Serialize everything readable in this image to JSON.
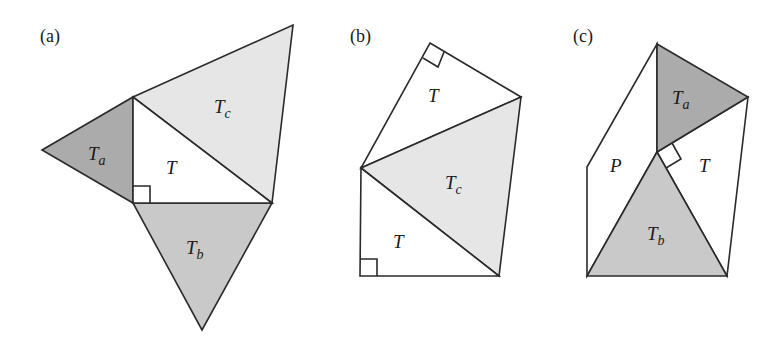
{
  "colors": {
    "stroke": "#2a2a2a",
    "Ta": "#ababab",
    "Tb": "#c9c9c9",
    "Tc": "#e6e6e6",
    "T": "#ffffff",
    "background": "#ffffff"
  },
  "panels": [
    {
      "id": "a",
      "label": "(a)",
      "regions": [
        {
          "name": "T",
          "main": "T",
          "sub": ""
        },
        {
          "name": "Ta",
          "main": "T",
          "sub": "a"
        },
        {
          "name": "Tb",
          "main": "T",
          "sub": "b"
        },
        {
          "name": "Tc",
          "main": "T",
          "sub": "c"
        }
      ]
    },
    {
      "id": "b",
      "label": "(b)",
      "regions": [
        {
          "name": "T-top",
          "main": "T",
          "sub": ""
        },
        {
          "name": "Tc",
          "main": "T",
          "sub": "c"
        },
        {
          "name": "T-bottom",
          "main": "T",
          "sub": ""
        }
      ]
    },
    {
      "id": "c",
      "label": "(c)",
      "regions": [
        {
          "name": "Ta",
          "main": "T",
          "sub": "a"
        },
        {
          "name": "P",
          "main": "P",
          "sub": ""
        },
        {
          "name": "T",
          "main": "T",
          "sub": ""
        },
        {
          "name": "Tb",
          "main": "T",
          "sub": "b"
        }
      ]
    }
  ]
}
